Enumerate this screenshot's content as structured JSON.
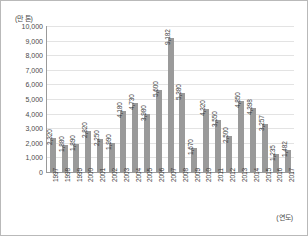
{
  "chart_data": {
    "type": "bar",
    "title": "",
    "subtitle": "",
    "xlabel": "(연도)",
    "ylabel": "(만 톤)",
    "ylim": [
      0,
      10000
    ],
    "ytick_labels": [
      "10,000",
      "9,000",
      "8,000",
      "7,000",
      "6,000",
      "5,000",
      "4,000",
      "3,000",
      "2,000",
      "1,000",
      "0"
    ],
    "ytick_values": [
      10000,
      9000,
      8000,
      7000,
      6000,
      5000,
      4000,
      3000,
      2000,
      1000,
      0
    ],
    "grid": true,
    "legend": "none",
    "bar_color": "#9a9a9a",
    "categories": [
      "1997",
      "1998",
      "1999",
      "2000",
      "2001",
      "2002",
      "2003",
      "2004",
      "2005",
      "2006",
      "2007",
      "2008",
      "2009",
      "2010",
      "2011",
      "2012",
      "2013",
      "2014",
      "2015",
      "2016",
      "2017"
    ],
    "values": [
      2320,
      1880,
      1890,
      2820,
      2250,
      1990,
      4180,
      4730,
      3980,
      5600,
      9182,
      5380,
      1670,
      4320,
      3550,
      2500,
      4850,
      4398,
      3257,
      1235,
      1482
    ],
    "data_labels": [
      "2,320",
      "1,880",
      "1,890",
      "2,820",
      "2,250",
      "1,990",
      "4,180",
      "4,730",
      "3,980",
      "5,600",
      "9,182",
      "5,380",
      "1,670",
      "4,320",
      "3,550",
      "2,500",
      "4,850",
      "4,398",
      "3,257",
      "1,235",
      "1,482"
    ]
  }
}
